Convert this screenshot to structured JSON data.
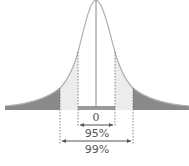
{
  "diagram": {
    "type": "normal-distribution",
    "center_label": "0",
    "intervals": [
      {
        "label": "95%",
        "color": "#ececec"
      },
      {
        "label": "99%",
        "color": "#ececec"
      }
    ],
    "tail_color": "#8a8a8a",
    "inner_color": "#ececec",
    "curve_color": "#b0b0b0",
    "line_color": "#777777"
  }
}
